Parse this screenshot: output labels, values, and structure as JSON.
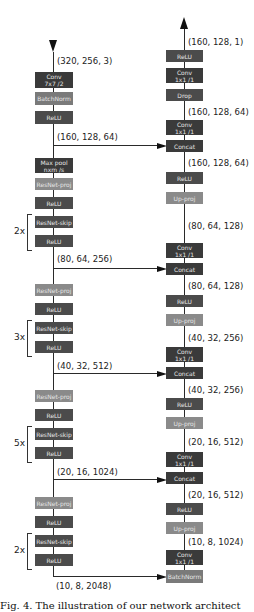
{
  "encoder": {
    "input_dim": "(320, 256, 3)",
    "blocks": [
      {
        "label1": "Conv",
        "label2": "7x7 /2"
      },
      {
        "label1": "BatchNorm"
      },
      {
        "label1": "ReLU"
      },
      {
        "label1": "Max pool",
        "label2": "nxm /s"
      },
      {
        "label1": "ResNet-proj"
      },
      {
        "label1": "ReLU"
      },
      {
        "label1": "ResNet-skip"
      },
      {
        "label1": "ReLU"
      },
      {
        "label1": "ResNet-proj"
      },
      {
        "label1": "ReLU"
      },
      {
        "label1": "ResNet-skip"
      },
      {
        "label1": "ReLU"
      },
      {
        "label1": "ResNet-proj"
      },
      {
        "label1": "ReLU"
      },
      {
        "label1": "ResNet-skip"
      },
      {
        "label1": "ReLU"
      },
      {
        "label1": "ResNet-proj"
      },
      {
        "label1": "ReLU"
      },
      {
        "label1": "ResNet-skip"
      },
      {
        "label1": "ReLU"
      }
    ],
    "dims": [
      "(160, 128, 64)",
      "(80, 64, 256)",
      "(40, 32, 512)",
      "(20, 16, 1024)",
      "(10, 8, 2048)"
    ],
    "repeats": [
      "2x",
      "3x",
      "5x",
      "2x"
    ]
  },
  "decoder": {
    "output_dim": "(160, 128, 1)",
    "blocks": [
      {
        "label1": "ReLU"
      },
      {
        "label1": "Conv",
        "label2": "1x1 /1"
      },
      {
        "label1": "Drop"
      },
      {
        "label1": "Conv",
        "label2": "1x1 /1"
      },
      {
        "label1": "Concat"
      },
      {
        "label1": "ReLU"
      },
      {
        "label1": "Up-proj"
      },
      {
        "label1": "Conv",
        "label2": "1x1 /1"
      },
      {
        "label1": "Concat"
      },
      {
        "label1": "ReLU"
      },
      {
        "label1": "Up-proj"
      },
      {
        "label1": "Conv",
        "label2": "1x1 /1"
      },
      {
        "label1": "Concat"
      },
      {
        "label1": "ReLU"
      },
      {
        "label1": "Up-proj"
      },
      {
        "label1": "Conv",
        "label2": "1x1 /1"
      },
      {
        "label1": "Concat"
      },
      {
        "label1": "ReLU"
      },
      {
        "label1": "Up-proj"
      },
      {
        "label1": "Conv",
        "label2": "1x1 /1"
      },
      {
        "label1": "BatchNorm"
      }
    ],
    "dims": [
      "(160, 128, 64)",
      "(160, 128, 64)",
      "(80, 64, 128)",
      "(80, 64, 128)",
      "(40, 32, 256)",
      "(40, 32, 256)",
      "(20, 16, 512)",
      "(20, 16, 512)",
      "(10, 8, 1024)"
    ]
  },
  "caption": "Fig. 4. The illustration of our network architect"
}
